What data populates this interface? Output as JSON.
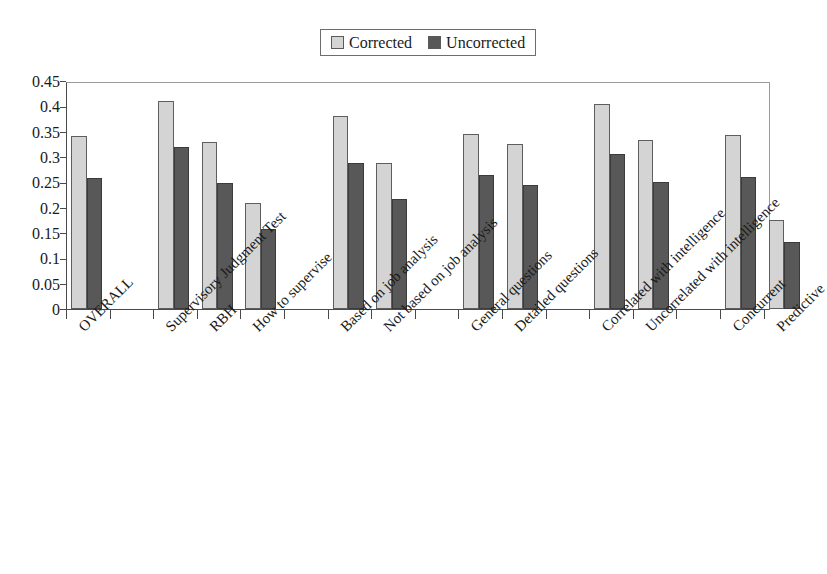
{
  "legend": {
    "entries": [
      {
        "label": "Corrected",
        "color": "#d4d4d4",
        "swatch_name": "legend-swatch-corrected"
      },
      {
        "label": "Uncorrected",
        "color": "#585858",
        "swatch_name": "legend-swatch-uncorrected"
      }
    ]
  },
  "axis": {
    "y_ticks": [
      "0.45",
      "0.4",
      "0.35",
      "0.3",
      "0.25",
      "0.2",
      "0.15",
      "0.1",
      "0.05",
      "0"
    ]
  },
  "chart_data": {
    "type": "bar",
    "title": "",
    "xlabel": "",
    "ylabel": "",
    "ylim": [
      0,
      0.45
    ],
    "ytick_step": 0.05,
    "grid": false,
    "legend_position": "top-center",
    "orientation": "vertical",
    "rotated_xticklabels": -45,
    "categories": [
      "OVERALL",
      "Supervisory Judgment Test",
      "RBH",
      "How to supervise",
      "Based on job analysis",
      "Not based on job analysis",
      "General questions",
      "Detailed questions",
      "Correlated with intelligence",
      "Uncorrelated with intelligence",
      "Concurrent",
      "Predictive"
    ],
    "groups": [
      {
        "name": "Overall",
        "categories": [
          "OVERALL"
        ]
      },
      {
        "name": "Instrument",
        "categories": [
          "Supervisory Judgment Test",
          "RBH",
          "How to supervise"
        ]
      },
      {
        "name": "Job analysis basis",
        "categories": [
          "Based on job analysis",
          "Not based on job analysis"
        ]
      },
      {
        "name": "Question type",
        "categories": [
          "General questions",
          "Detailed questions"
        ]
      },
      {
        "name": "Intelligence overlap",
        "categories": [
          "Correlated with intelligence",
          "Uncorrelated with intelligence"
        ]
      },
      {
        "name": "Design",
        "categories": [
          "Concurrent",
          "Predictive"
        ]
      }
    ],
    "series": [
      {
        "name": "Corrected",
        "color": "#d4d4d4",
        "values": [
          0.342,
          0.41,
          0.33,
          0.21,
          0.38,
          0.288,
          0.346,
          0.326,
          0.404,
          0.334,
          0.344,
          0.175
        ]
      },
      {
        "name": "Uncorrected",
        "color": "#585858",
        "values": [
          0.259,
          0.32,
          0.248,
          0.157,
          0.288,
          0.217,
          0.265,
          0.244,
          0.305,
          0.251,
          0.261,
          0.133
        ]
      }
    ]
  }
}
